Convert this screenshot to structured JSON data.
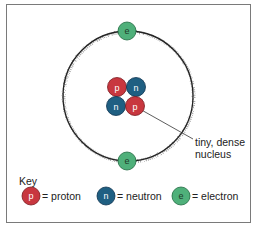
{
  "diagram": {
    "nucleus": [
      {
        "type": "proton",
        "label": "p",
        "pos": "top-left"
      },
      {
        "type": "neutron",
        "label": "n",
        "pos": "top-right"
      },
      {
        "type": "neutron",
        "label": "n",
        "pos": "bottom-left"
      },
      {
        "type": "proton",
        "label": "p",
        "pos": "bottom-right"
      }
    ],
    "electrons": [
      {
        "label": "e",
        "pos": "top"
      },
      {
        "label": "e",
        "pos": "bottom"
      }
    ],
    "annotation": {
      "line1": "tiny, dense",
      "line2": "nucleus"
    },
    "key": {
      "title": "Key",
      "items": [
        {
          "symbol": "p",
          "text": "= proton"
        },
        {
          "symbol": "n",
          "text": "= neutron"
        },
        {
          "symbol": "e",
          "text": "= electron"
        }
      ]
    },
    "colors": {
      "proton": "#c8373f",
      "neutron": "#1f5f82",
      "electron": "#4fb07a",
      "orbit": "#222222"
    }
  }
}
